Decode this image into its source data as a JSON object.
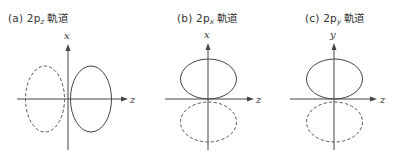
{
  "panels": [
    {
      "id": "a",
      "label": "(a)",
      "orbital_prefix": "2p",
      "orbital_subscript": "z",
      "suffix": "軌道",
      "vertical_axis_label": "x",
      "horizontal_axis_label": "z",
      "orientation": "horizontal",
      "solid_lobe": "positive-z",
      "dashed_lobe": "negative-z"
    },
    {
      "id": "b",
      "label": "(b)",
      "orbital_prefix": "2p",
      "orbital_subscript": "x",
      "suffix": "軌道",
      "vertical_axis_label": "x",
      "horizontal_axis_label": "z",
      "orientation": "vertical",
      "solid_lobe": "positive-x",
      "dashed_lobe": "negative-x"
    },
    {
      "id": "c",
      "label": "(c)",
      "orbital_prefix": "2p",
      "orbital_subscript": "y",
      "suffix": "軌道",
      "vertical_axis_label": "y",
      "horizontal_axis_label": "z",
      "orientation": "vertical",
      "solid_lobe": "positive-y",
      "dashed_lobe": "negative-y"
    }
  ],
  "colors": {
    "line": "#444444",
    "text": "#333333",
    "background": "#ffffff"
  }
}
